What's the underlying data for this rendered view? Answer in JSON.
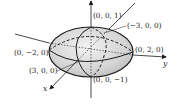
{
  "figure": {
    "type": "ellipsoid-3d-plot",
    "axes": {
      "x_label": "x",
      "y_label": "y",
      "z_label": "z"
    },
    "points": [
      {
        "id": "z_top",
        "label": "(0, 0, 1)"
      },
      {
        "id": "x_neg",
        "label": "(−3, 0, 0)"
      },
      {
        "id": "y_neg",
        "label": "(0, −2, 0)"
      },
      {
        "id": "y_pos",
        "label": "(0, 2, 0)"
      },
      {
        "id": "x_pos",
        "label": "(3, 0, 0)"
      },
      {
        "id": "z_bottom",
        "label": "(0, 0, −1)"
      }
    ],
    "colors": {
      "fill": "#d9d9d9",
      "stroke": "#1a1a1a",
      "background": "#ffffff"
    }
  }
}
